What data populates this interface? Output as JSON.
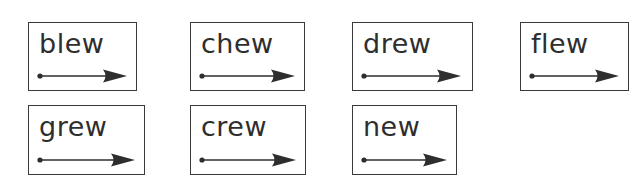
{
  "colors": {
    "ink": "#2e2e2e",
    "border": "#3a3a3a",
    "background": "#ffffff"
  },
  "cards": [
    {
      "word": "blew",
      "x": 28,
      "y": 22,
      "w": 109,
      "h": 69,
      "arrow_len": 90
    },
    {
      "word": "chew",
      "x": 190,
      "y": 22,
      "w": 115,
      "h": 69,
      "arrow_len": 96
    },
    {
      "word": "drew",
      "x": 352,
      "y": 22,
      "w": 121,
      "h": 69,
      "arrow_len": 100
    },
    {
      "word": "flew",
      "x": 520,
      "y": 22,
      "w": 109,
      "h": 69,
      "arrow_len": 90
    },
    {
      "word": "grew",
      "x": 28,
      "y": 105,
      "w": 117,
      "h": 70,
      "arrow_len": 98
    },
    {
      "word": "crew",
      "x": 190,
      "y": 105,
      "w": 116,
      "h": 70,
      "arrow_len": 97
    },
    {
      "word": "new",
      "x": 352,
      "y": 105,
      "w": 105,
      "h": 70,
      "arrow_len": 86
    }
  ]
}
